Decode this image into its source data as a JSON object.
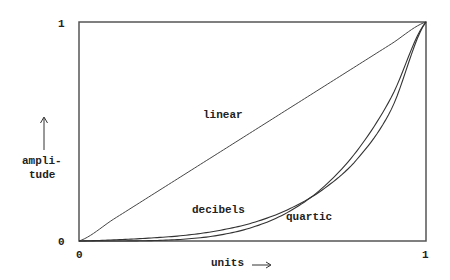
{
  "chart_data": {
    "type": "line",
    "title": "",
    "xlabel": "units",
    "ylabel": "ampli-tude",
    "ylabel_lines": [
      "ampli-",
      "tude"
    ],
    "xlim": [
      0,
      1
    ],
    "ylim": [
      0,
      1
    ],
    "grid": false,
    "legend": "inline labels",
    "x_ticks": [
      "0",
      "1"
    ],
    "y_ticks": [
      "0",
      "1"
    ],
    "x": [
      0,
      0.1,
      0.2,
      0.3,
      0.4,
      0.5,
      0.6,
      0.7,
      0.8,
      0.9,
      1.0
    ],
    "series": [
      {
        "name": "linear",
        "values": [
          0,
          0.1,
          0.2,
          0.3,
          0.4,
          0.5,
          0.6,
          0.7,
          0.8,
          0.9,
          1.0
        ]
      },
      {
        "name": "decibels",
        "values": [
          0,
          0.005,
          0.013,
          0.025,
          0.047,
          0.083,
          0.142,
          0.232,
          0.371,
          0.601,
          1.0
        ]
      },
      {
        "name": "quartic",
        "values": [
          0,
          0.0001,
          0.0016,
          0.0081,
          0.0256,
          0.0625,
          0.1296,
          0.2401,
          0.4096,
          0.6561,
          1.0
        ]
      }
    ],
    "annotations": [
      {
        "text": "linear",
        "x": 0.36,
        "y": 0.58
      },
      {
        "text": "decibels",
        "x": 0.32,
        "y": 0.14
      },
      {
        "text": "quartic",
        "x": 0.6,
        "y": 0.1
      }
    ]
  },
  "labels": {
    "y_top": "1",
    "y_bottom": "0",
    "x_left": "0",
    "x_right": "1",
    "xlabel": "units",
    "ylabel_1": "ampli-",
    "ylabel_2": "tude",
    "linear": "linear",
    "decibels": "decibels",
    "quartic": "quartic"
  },
  "colors": {
    "axis": "#555555",
    "line": "#333333"
  }
}
